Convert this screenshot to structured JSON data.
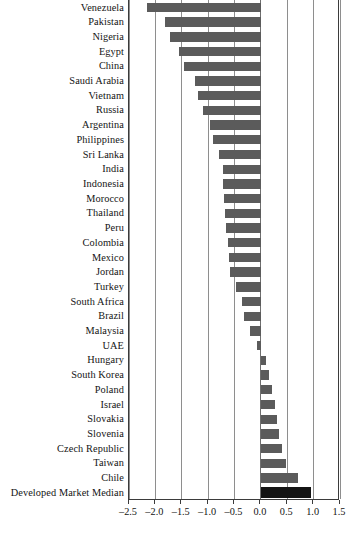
{
  "chart_data": {
    "type": "bar",
    "orientation": "horizontal",
    "title": "",
    "subtitle": "",
    "xlabel": "",
    "ylabel": "",
    "xlim": [
      -2.5,
      1.5
    ],
    "xticks": [
      -2.5,
      -2.0,
      -1.5,
      -1.0,
      -0.5,
      0.0,
      0.5,
      1.0,
      1.5
    ],
    "xtick_labels": [
      "–2.5",
      "–2.0",
      "–1.5",
      "–1.0",
      "–0.5",
      "0.0",
      "0.5",
      "1.0",
      "1.5"
    ],
    "grid": true,
    "grid_axis": "x",
    "legend": false,
    "categories": [
      "Venezuela",
      "Pakistan",
      "Nigeria",
      "Egypt",
      "China",
      "Saudi Arabia",
      "Vietnam",
      "Russia",
      "Argentina",
      "Philippines",
      "Sri Lanka",
      "India",
      "Indonesia",
      "Morocco",
      "Thailand",
      "Peru",
      "Colombia",
      "Mexico",
      "Jordan",
      "Turkey",
      "South Africa",
      "Brazil",
      "Malaysia",
      "UAE",
      "Hungary",
      "South Korea",
      "Poland",
      "Israel",
      "Slovakia",
      "Slovenia",
      "Czech Republic",
      "Taiwan",
      "Chile",
      "Developed Market Median"
    ],
    "values": [
      -2.15,
      -1.82,
      -1.72,
      -1.55,
      -1.45,
      -1.25,
      -1.2,
      -1.1,
      -0.96,
      -0.9,
      -0.8,
      -0.72,
      -0.72,
      -0.7,
      -0.68,
      -0.66,
      -0.62,
      -0.6,
      -0.58,
      -0.48,
      -0.36,
      -0.32,
      -0.2,
      -0.08,
      0.1,
      0.16,
      0.22,
      0.26,
      0.3,
      0.34,
      0.4,
      0.48,
      0.7,
      0.95
    ],
    "highlight_category": "Developed Market Median",
    "colors": {
      "bar": "#5b5b5b",
      "highlight_bar": "#141414",
      "gridline": "#8e8e8e",
      "axis": "#3b3b3b",
      "text": "#141414",
      "background": "#ffffff"
    }
  },
  "caption": ""
}
